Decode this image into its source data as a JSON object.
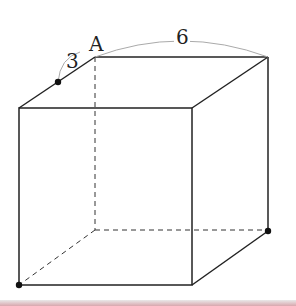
{
  "diagram": {
    "type": "cube",
    "labels": {
      "vertex_a": "A",
      "edge_segment": "3",
      "edge_length": "6"
    },
    "colors": {
      "line": "#222222",
      "arc": "#aaaaaa",
      "point": "#111111"
    }
  }
}
